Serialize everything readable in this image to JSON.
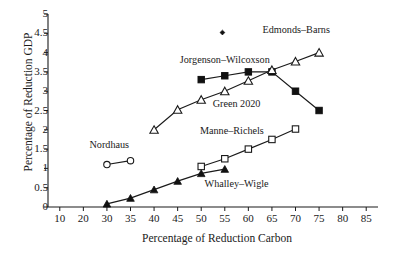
{
  "chart_data": {
    "type": "line",
    "title": "",
    "xlabel": "Percentage of Reduction Carbon",
    "ylabel": "Percentage of Reduction GDP",
    "xticks": [
      10,
      20,
      30,
      35,
      40,
      45,
      50,
      55,
      60,
      65,
      70,
      75,
      80,
      85
    ],
    "yticks": [
      0,
      0.5,
      1,
      1.5,
      2,
      2.5,
      3,
      3.5,
      4,
      4.5,
      5
    ],
    "ylim": [
      0,
      5
    ],
    "grid": false,
    "legend_position": "inline-annotations",
    "series": [
      {
        "name": "Jorgenson–Wilcoxson",
        "marker": "filled-square",
        "x": [
          50,
          55,
          60,
          65,
          70,
          75
        ],
        "values": [
          3.3,
          3.4,
          3.5,
          3.5,
          3.0,
          2.5
        ],
        "label_x": 55,
        "label_y": 3.72
      },
      {
        "name": "Green 2020",
        "marker": "open-triangle",
        "x": [
          40,
          45,
          50,
          55,
          60,
          65,
          70,
          75
        ],
        "values": [
          2.0,
          2.52,
          2.78,
          3.0,
          3.27,
          3.55,
          3.77,
          4.0
        ],
        "label_x": 57.5,
        "label_y": 2.6
      },
      {
        "name": "Manne–Richels",
        "marker": "open-square",
        "x": [
          50,
          55,
          60,
          65,
          70
        ],
        "values": [
          1.05,
          1.25,
          1.5,
          1.75,
          2.02
        ],
        "label_x": 56.5,
        "label_y": 1.88
      },
      {
        "name": "Whalley–Wigle",
        "marker": "filled-triangle",
        "x": [
          30,
          35,
          40,
          45,
          50,
          55
        ],
        "values": [
          0.08,
          0.23,
          0.45,
          0.67,
          0.87,
          0.98
        ],
        "label_x": 57.5,
        "label_y": 0.52
      },
      {
        "name": "Nordhaus",
        "marker": "open-circle",
        "x": [
          30,
          35
        ],
        "values": [
          1.1,
          1.2
        ],
        "label_x": 30.5,
        "label_y": 1.52
      },
      {
        "name": "Edmonds–Barns",
        "marker": "filled-diamond",
        "x": [],
        "values": [],
        "legend_only": true,
        "legend_marker_x": 54.5,
        "legend_marker_y": 4.52,
        "label_x": 63,
        "label_y": 4.52
      }
    ]
  },
  "colors": {
    "axis": "#1a1a1a",
    "marker_fill": "#111111",
    "marker_open_fill": "#ffffff",
    "line": "#1a1a1a",
    "text": "#1a1a1a",
    "background": "#ffffff"
  }
}
